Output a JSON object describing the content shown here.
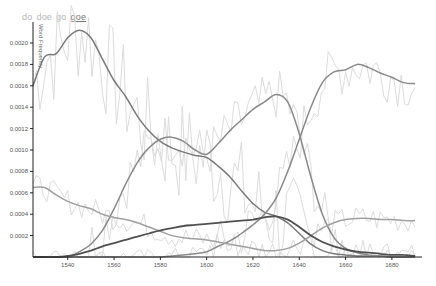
{
  "legend": {
    "items": [
      {
        "label": "do",
        "active": false
      },
      {
        "label": "doe",
        "active": false
      },
      {
        "label": "go",
        "active": false
      },
      {
        "label": "goe",
        "active": true
      }
    ]
  },
  "chart_data": {
    "type": "line",
    "title": "",
    "xlabel": "",
    "ylabel": "Word Frequency",
    "xlim": [
      1525,
      1693
    ],
    "ylim": [
      0,
      0.0022
    ],
    "grid": false,
    "legend_position": "top-left",
    "x_ticks": [
      1540,
      1560,
      1580,
      1600,
      1620,
      1640,
      1660,
      1680
    ],
    "y_ticks": [
      "0.0002",
      "0.0004",
      "0.0006",
      "0.0008",
      "0.0010",
      "0.0012",
      "0.0014",
      "0.0016",
      "0.0018",
      "0.0020"
    ],
    "x": [
      1525,
      1530,
      1535,
      1540,
      1545,
      1550,
      1555,
      1560,
      1565,
      1570,
      1575,
      1580,
      1585,
      1590,
      1595,
      1600,
      1605,
      1610,
      1615,
      1620,
      1625,
      1630,
      1635,
      1640,
      1645,
      1650,
      1655,
      1660,
      1665,
      1670,
      1675,
      1680,
      1685,
      1690
    ],
    "series": [
      {
        "name": "smoothed-early-peak",
        "color": "#7a7a7a",
        "values": [
          0.0016,
          0.00187,
          0.0019,
          0.00205,
          0.00212,
          0.00205,
          0.00185,
          0.00165,
          0.0015,
          0.00132,
          0.00118,
          0.00108,
          0.00102,
          0.00098,
          0.00095,
          0.00093,
          0.00085,
          0.00075,
          0.00062,
          0.0005,
          0.00042,
          0.00038,
          0.00032,
          0.00022,
          0.00012,
          6e-05,
          3e-05,
          2e-05,
          1e-05,
          1e-05,
          1e-05,
          0.0,
          0.0,
          0.0
        ]
      },
      {
        "name": "smoothed-mid-hump",
        "color": "#8a8a8a",
        "values": [
          0.0,
          0.0,
          0.0,
          0.0,
          5e-05,
          0.00012,
          0.00025,
          0.00045,
          0.00068,
          0.00088,
          0.00102,
          0.0011,
          0.00112,
          0.00108,
          0.001,
          0.00096,
          0.00106,
          0.00118,
          0.00128,
          0.00138,
          0.00145,
          0.00152,
          0.00145,
          0.00115,
          0.00075,
          0.0004,
          0.00018,
          8e-05,
          4e-05,
          2e-05,
          1e-05,
          0.0,
          0.0,
          0.0
        ]
      },
      {
        "name": "smoothed-late-rise",
        "color": "#8a8a8a",
        "values": [
          0.0,
          0.0,
          0.0,
          0.0,
          0.0,
          0.0,
          0.0,
          0.0,
          0.0,
          0.0,
          0.0,
          0.0,
          1e-05,
          2e-05,
          3e-05,
          5e-05,
          0.0001,
          0.00015,
          0.00022,
          0.0003,
          0.0004,
          0.00055,
          0.0008,
          0.0011,
          0.0014,
          0.00163,
          0.00173,
          0.00175,
          0.0018,
          0.00177,
          0.00172,
          0.00168,
          0.00163,
          0.00162
        ]
      },
      {
        "name": "smoothed-low-decline",
        "color": "#a0a0a0",
        "values": [
          0.00065,
          0.00065,
          0.00058,
          0.00052,
          0.00048,
          0.00045,
          0.0004,
          0.00037,
          0.00035,
          0.00032,
          0.00028,
          0.00024,
          0.0002,
          0.00018,
          0.00017,
          0.00016,
          0.00014,
          0.00012,
          0.0001,
          8e-05,
          6e-05,
          6e-05,
          8e-05,
          0.00013,
          0.0002,
          0.00027,
          0.00032,
          0.00035,
          0.00036,
          0.00036,
          0.00035,
          0.00035,
          0.00034,
          0.00034
        ]
      },
      {
        "name": "goe",
        "color": "#505050",
        "values": [
          0.0,
          0.0,
          0.0,
          1e-05,
          3e-05,
          6e-05,
          0.0001,
          0.00013,
          0.00016,
          0.00019,
          0.00022,
          0.00025,
          0.00027,
          0.00029,
          0.0003,
          0.00031,
          0.00032,
          0.00033,
          0.00034,
          0.00035,
          0.00037,
          0.00038,
          0.00035,
          0.00028,
          0.0002,
          0.00014,
          0.0001,
          7e-05,
          5e-05,
          4e-05,
          3e-05,
          2e-05,
          2e-05,
          1e-05
        ]
      }
    ],
    "raw_noisy_series_note": "light gray jagged lines behind smoothed curves"
  },
  "colors": {
    "axis": "#222222",
    "raw_line": "#dcdcdc"
  }
}
